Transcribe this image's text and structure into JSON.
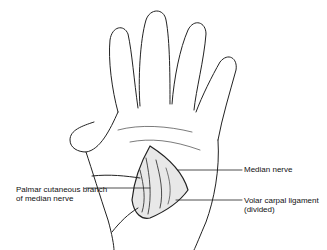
{
  "figure": {
    "labels": {
      "median_nerve": "Median nerve",
      "palmar_branch_line1": "Palmar cutaneous branch",
      "palmar_branch_line2": "of median nerve",
      "volar_ligament_line1": "Volar carpal ligament",
      "volar_ligament_line2": "(divided)"
    },
    "colors": {
      "ink": "#111111",
      "background": "#ffffff"
    }
  }
}
